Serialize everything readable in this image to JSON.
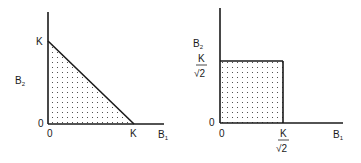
{
  "left_panel": {
    "y_axis_label": "B",
    "y_axis_sub": "2",
    "x_axis_label": "B",
    "x_axis_sub": "1",
    "y_intercept_label": "K",
    "x_intercept_label": "K",
    "origin_y_label": "0",
    "origin_x_label": "0",
    "region": "triangle (shaded with dots)"
  },
  "right_panel": {
    "y_axis_label": "B",
    "y_axis_sub": "2",
    "x_axis_label": "B",
    "x_axis_sub": "1",
    "y_bound_numerator": "K",
    "y_bound_denominator": "√2",
    "x_bound_numerator": "K",
    "x_bound_denominator": "√2",
    "origin_y_label": "0",
    "origin_x_label": "0",
    "region": "square (shaded with dots)"
  },
  "colors": {
    "ink": "#1a1a1a",
    "background": "#ffffff"
  }
}
